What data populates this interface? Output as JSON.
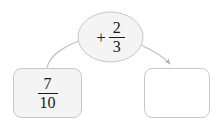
{
  "canvas": {
    "width": 218,
    "height": 126,
    "background_color": "#ffffff"
  },
  "style": {
    "shape_fill": "#f4f4f4",
    "shape_stroke": "#c8c8c8",
    "empty_shape_fill": "#ffffff",
    "arrow_color": "#b0b0b0",
    "text_color": "#1a1a1a"
  },
  "diagram": {
    "type": "fraction-arithmetic-flow",
    "nodes": {
      "start": {
        "shape": "rounded-rectangle",
        "numerator": "7",
        "denominator": "10",
        "filled": true
      },
      "operand": {
        "shape": "ellipse",
        "operator": "+",
        "numerator": "2",
        "denominator": "3",
        "filled": true
      },
      "result": {
        "shape": "rounded-rectangle",
        "value": "",
        "filled": false
      }
    },
    "edges": [
      {
        "name": "start-to-operand",
        "from": "start",
        "to": "operand",
        "arrowhead": false
      },
      {
        "name": "operand-to-result",
        "from": "operand",
        "to": "result",
        "arrowhead": true
      }
    ]
  }
}
